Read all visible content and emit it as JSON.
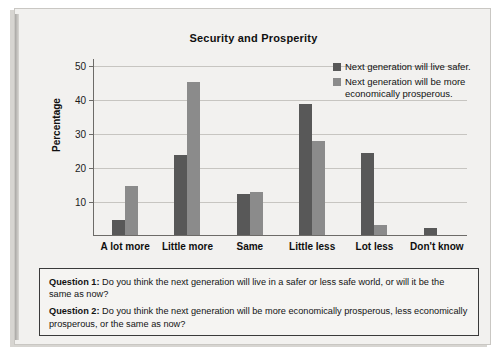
{
  "chart_data": {
    "type": "bar",
    "title": "Security and Prosperity",
    "xlabel": "",
    "ylabel": "Percentage",
    "ylim": [
      0,
      52
    ],
    "yticks": [
      10,
      20,
      30,
      40,
      50
    ],
    "grid": true,
    "legend_position": "top-right",
    "categories": [
      "A lot more",
      "Little more",
      "Same",
      "Little less",
      "Lot less",
      "Don't know"
    ],
    "series": [
      {
        "name": "Next generation will live safer.",
        "color": "#585858",
        "values": [
          4.5,
          23.5,
          12,
          38.5,
          24,
          2
        ]
      },
      {
        "name": "Next generation will be more economically prosperous.",
        "color": "#8b8b8b",
        "values": [
          14.5,
          45,
          12.5,
          27.5,
          3,
          0
        ]
      }
    ]
  },
  "legend": {
    "items": [
      {
        "label": "Next generation will live safer.",
        "color": "#585858"
      },
      {
        "label": "Next generation will be more economically prosperous.",
        "color": "#8b8b8b"
      }
    ]
  },
  "questions": [
    {
      "label": "Question 1:",
      "text": "Do you think the next generation will live in a safer or less safe world, or will it be the same as now?"
    },
    {
      "label": "Question 2:",
      "text": "Do you think the next generation will be more economically prosperous, less economically prosperous, or the same as now?"
    }
  ]
}
